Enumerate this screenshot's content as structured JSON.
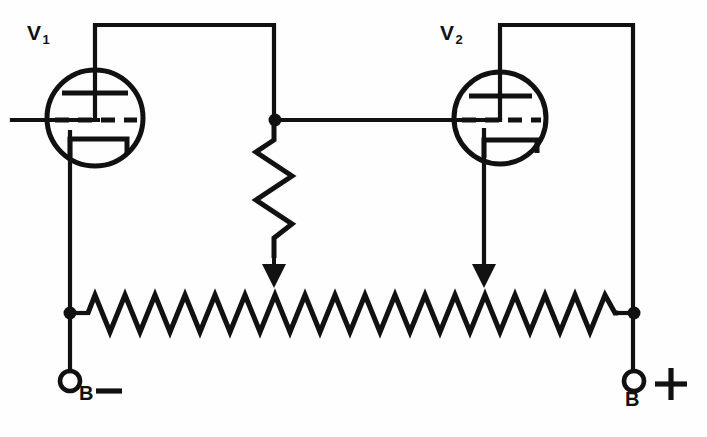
{
  "diagram": {
    "type": "schematic",
    "width": 707,
    "height": 437,
    "background_color": "#fefefe",
    "line_color": "#111111"
  },
  "labels": {
    "v1": {
      "text": "V",
      "subscript": "1",
      "full": "V1"
    },
    "v2": {
      "text": "V",
      "subscript": "2",
      "full": "V2"
    },
    "b_minus": {
      "text": "B",
      "sign": "—",
      "full": "B —"
    },
    "b_plus": {
      "text": "B",
      "sign": "+",
      "full": "B +"
    }
  },
  "components": {
    "tubes": [
      {
        "id": "v1",
        "name": "vacuum-tube-v1",
        "label": "V1",
        "cx": 95,
        "cy": 118,
        "r": 48,
        "elements": [
          "plate",
          "grid",
          "cathode"
        ],
        "plate_lead": "top",
        "grid_lead": "left",
        "cathode_lead": "bottom-left"
      },
      {
        "id": "v2",
        "name": "vacuum-tube-v2",
        "label": "V2",
        "cx": 500,
        "cy": 118,
        "r": 46,
        "elements": [
          "plate",
          "grid",
          "cathode"
        ],
        "plate_lead": "top",
        "grid_lead": "left",
        "cathode_lead": "bottom-left"
      }
    ],
    "resistors": [
      {
        "id": "r-vertical",
        "name": "vertical-potentiometer",
        "orientation": "vertical",
        "x": 276,
        "y_top": 124,
        "y_bottom": 252,
        "zigzag_peaks": 4,
        "amplitude": 18,
        "has_tap_arrow": true
      },
      {
        "id": "r-horizontal",
        "name": "horizontal-bleeder-resistor",
        "orientation": "horizontal",
        "y": 313,
        "x_left": 75,
        "x_right": 635,
        "zigzag_peaks": 18,
        "amplitude": 20
      }
    ],
    "tap_arrows": [
      {
        "id": "tap-1",
        "name": "tap-arrow-left",
        "x": 276,
        "y_from": 240,
        "y_to": 286
      },
      {
        "id": "tap-2",
        "name": "tap-arrow-right",
        "x": 484,
        "y_from": 165,
        "y_to": 286
      }
    ],
    "terminals": [
      {
        "id": "b-minus",
        "name": "terminal-b-minus",
        "cx": 70,
        "cy": 381,
        "r": 10,
        "label": "B —"
      },
      {
        "id": "b-plus",
        "name": "terminal-b-plus",
        "cx": 635,
        "cy": 381,
        "r": 10,
        "label": "B +"
      }
    ],
    "junction_dots": [
      {
        "id": "j-center",
        "name": "junction-center",
        "cx": 276,
        "cy": 120,
        "r": 6
      },
      {
        "id": "j-left",
        "name": "junction-left-rail",
        "cx": 70,
        "cy": 313,
        "r": 6
      },
      {
        "id": "j-right",
        "name": "junction-right-rail",
        "cx": 635,
        "cy": 313,
        "r": 6
      }
    ],
    "wires": [
      {
        "id": "w-v1-plate",
        "name": "wire-v1-plate-to-center",
        "path": "M95,118 L95,22 L276,22 L276,120"
      },
      {
        "id": "w-v1-grid",
        "name": "wire-v1-grid-input",
        "path": "M12,120 L95,120"
      },
      {
        "id": "w-v1-cathode",
        "name": "wire-v1-cathode-to-bminus",
        "path": "M70,130 L70,371"
      },
      {
        "id": "w-center-to-v2grid",
        "name": "wire-center-to-v2-grid",
        "path": "M276,120 L500,120"
      },
      {
        "id": "w-v2-plate",
        "name": "wire-v2-plate-to-bplus",
        "path": "M500,118 L500,22 L635,22 L635,371"
      },
      {
        "id": "w-v2-cathode",
        "name": "wire-v2-cathode-tap",
        "path": "M484,128 L484,286"
      }
    ]
  }
}
